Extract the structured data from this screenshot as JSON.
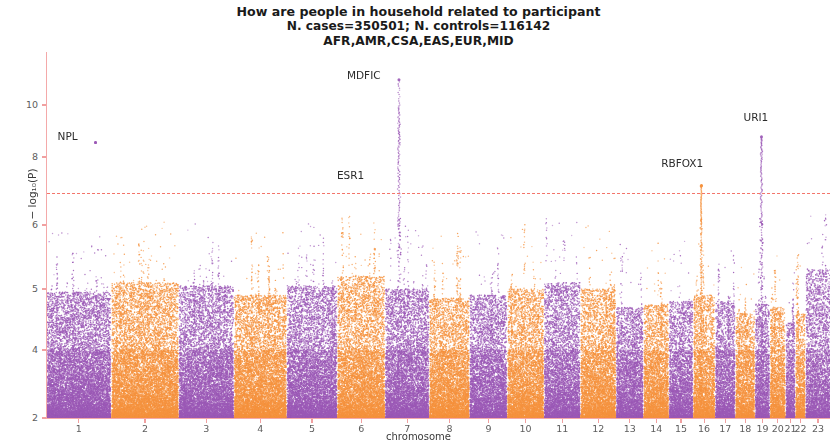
{
  "title": {
    "line1": "How are people in household related to participant",
    "line2": "N. cases=350501; N. controls=116142",
    "line3": "AFR,AMR,CSA,EAS,EUR,MID"
  },
  "axes": {
    "xlabel": "chromosome",
    "ylabel": "− log₁₀(P)",
    "ytick_labels": [
      "10",
      "8",
      "6",
      "5",
      "4",
      "2"
    ],
    "xtick_labels": [
      "1",
      "2",
      "3",
      "4",
      "5",
      "6",
      "7",
      "8",
      "9",
      "10",
      "11",
      "12",
      "13",
      "14",
      "15",
      "16",
      "17",
      "18",
      "19",
      "20",
      "21",
      "22",
      "23"
    ]
  },
  "colors": {
    "purple": "#9b59b6",
    "orange": "#f5923e",
    "significance_line": "#f4756b",
    "axis": "#f4a9a9",
    "text": "#2b2b2b"
  },
  "chart_data": {
    "type": "scatter",
    "title": "How are people in household related to participant",
    "subtitle": "N. cases=350501; N. controls=116142 | AFR,AMR,CSA,EAS,EUR,MID",
    "xlabel": "chromosome",
    "ylabel": "-log10(P)",
    "ylim": [
      2,
      10.8
    ],
    "ytick_values": [
      10,
      8,
      6,
      5,
      4,
      2
    ],
    "yscale": "nonlinear-compressed",
    "grid": false,
    "legend": null,
    "significance_threshold": 7.3,
    "significance_line_style": "dashed",
    "n_cases": 350501,
    "n_controls": 116142,
    "ancestries": [
      "AFR",
      "AMR",
      "CSA",
      "EAS",
      "EUR",
      "MID"
    ],
    "categories": [
      "1",
      "2",
      "3",
      "4",
      "5",
      "6",
      "7",
      "8",
      "9",
      "10",
      "11",
      "12",
      "13",
      "14",
      "15",
      "16",
      "17",
      "18",
      "19",
      "20",
      "21",
      "22",
      "23"
    ],
    "chromosomes": [
      {
        "chrom": "1",
        "color": "purple",
        "start_frac": 0.0,
        "width_frac": 0.081,
        "density": 1.0,
        "baseline_top": 4.95
      },
      {
        "chrom": "2",
        "color": "orange",
        "start_frac": 0.083,
        "width_frac": 0.0845,
        "density": 1.0,
        "baseline_top": 5.1
      },
      {
        "chrom": "3",
        "color": "purple",
        "start_frac": 0.169,
        "width_frac": 0.069,
        "density": 0.96,
        "baseline_top": 5.05
      },
      {
        "chrom": "4",
        "color": "orange",
        "start_frac": 0.2395,
        "width_frac": 0.066,
        "density": 0.95,
        "baseline_top": 4.9
      },
      {
        "chrom": "5",
        "color": "purple",
        "start_frac": 0.307,
        "width_frac": 0.063,
        "density": 0.95,
        "baseline_top": 5.05
      },
      {
        "chrom": "6",
        "color": "orange",
        "start_frac": 0.3715,
        "width_frac": 0.0595,
        "density": 0.94,
        "baseline_top": 5.2
      },
      {
        "chrom": "7",
        "color": "purple",
        "start_frac": 0.4325,
        "width_frac": 0.055,
        "density": 0.93,
        "baseline_top": 5.0
      },
      {
        "chrom": "8",
        "color": "orange",
        "start_frac": 0.489,
        "width_frac": 0.05,
        "density": 0.92,
        "baseline_top": 4.85
      },
      {
        "chrom": "9",
        "color": "purple",
        "start_frac": 0.5405,
        "width_frac": 0.0465,
        "density": 0.9,
        "baseline_top": 4.9
      },
      {
        "chrom": "10",
        "color": "orange",
        "start_frac": 0.5885,
        "width_frac": 0.0455,
        "density": 0.9,
        "baseline_top": 5.0
      },
      {
        "chrom": "11",
        "color": "purple",
        "start_frac": 0.6355,
        "width_frac": 0.045,
        "density": 0.9,
        "baseline_top": 5.1
      },
      {
        "chrom": "12",
        "color": "orange",
        "start_frac": 0.682,
        "width_frac": 0.044,
        "density": 0.9,
        "baseline_top": 5.0
      },
      {
        "chrom": "13",
        "color": "purple",
        "start_frac": 0.7275,
        "width_frac": 0.0335,
        "density": 0.86,
        "baseline_top": 4.7
      },
      {
        "chrom": "14",
        "color": "orange",
        "start_frac": 0.7625,
        "width_frac": 0.031,
        "density": 0.86,
        "baseline_top": 4.75
      },
      {
        "chrom": "15",
        "color": "purple",
        "start_frac": 0.795,
        "width_frac": 0.0295,
        "density": 0.85,
        "baseline_top": 4.8
      },
      {
        "chrom": "16",
        "color": "orange",
        "start_frac": 0.826,
        "width_frac": 0.0265,
        "density": 0.85,
        "baseline_top": 4.9
      },
      {
        "chrom": "17",
        "color": "purple",
        "start_frac": 0.854,
        "width_frac": 0.0245,
        "density": 0.84,
        "baseline_top": 4.8
      },
      {
        "chrom": "18",
        "color": "orange",
        "start_frac": 0.88,
        "width_frac": 0.0235,
        "density": 0.83,
        "baseline_top": 4.6
      },
      {
        "chrom": "19",
        "color": "purple",
        "start_frac": 0.905,
        "width_frac": 0.0175,
        "density": 0.82,
        "baseline_top": 4.75
      },
      {
        "chrom": "20",
        "color": "orange",
        "start_frac": 0.924,
        "width_frac": 0.0185,
        "density": 0.82,
        "baseline_top": 4.7
      },
      {
        "chrom": "21",
        "color": "purple",
        "start_frac": 0.944,
        "width_frac": 0.011,
        "density": 0.78,
        "baseline_top": 4.45
      },
      {
        "chrom": "22",
        "color": "orange",
        "start_frac": 0.9565,
        "width_frac": 0.0115,
        "density": 0.78,
        "baseline_top": 4.6
      },
      {
        "chrom": "23",
        "color": "purple",
        "start_frac": 0.9695,
        "width_frac": 0.0305,
        "density": 0.88,
        "baseline_top": 5.3
      }
    ],
    "annotations": [
      {
        "gene": "NPL",
        "chrom": "1",
        "x_frac": 0.062,
        "y": 8.55,
        "color": "purple",
        "label_dx": -38,
        "label_dy": -4
      },
      {
        "gene": "MDFIC",
        "chrom": "7",
        "x_frac": 0.4495,
        "y": 10.42,
        "color": "purple",
        "label_dx": -52,
        "label_dy": -2
      },
      {
        "gene": "ESR1",
        "chrom": "7",
        "x_frac": 0.4495,
        "y": 7.3,
        "color": "purple",
        "label_dx": -62,
        "label_dy": -3
      },
      {
        "gene": "RBFOX1",
        "chrom": "16",
        "x_frac": 0.8355,
        "y": 7.15,
        "color": "orange",
        "label_dx": -40,
        "label_dy": -20
      },
      {
        "gene": "URI1",
        "chrom": "19",
        "x_frac": 0.9125,
        "y": 8.78,
        "color": "purple",
        "label_dx": -18,
        "label_dy": -17
      }
    ],
    "peaks": [
      {
        "gene": "MDFIC",
        "chrom": "7",
        "top": 10.42,
        "bottom": 2.0,
        "color": "purple",
        "width_px": 4
      },
      {
        "gene": "URI1",
        "chrom": "19",
        "top": 8.78,
        "bottom": 2.0,
        "color": "purple",
        "width_px": 3
      },
      {
        "gene": "RBFOX1",
        "chrom": "16",
        "top": 7.15,
        "bottom": 2.0,
        "color": "orange",
        "width_px": 2
      },
      {
        "gene": "NPL",
        "chrom": "1",
        "top": 8.55,
        "bottom": 8.55,
        "color": "purple",
        "width_px": 2
      }
    ]
  }
}
